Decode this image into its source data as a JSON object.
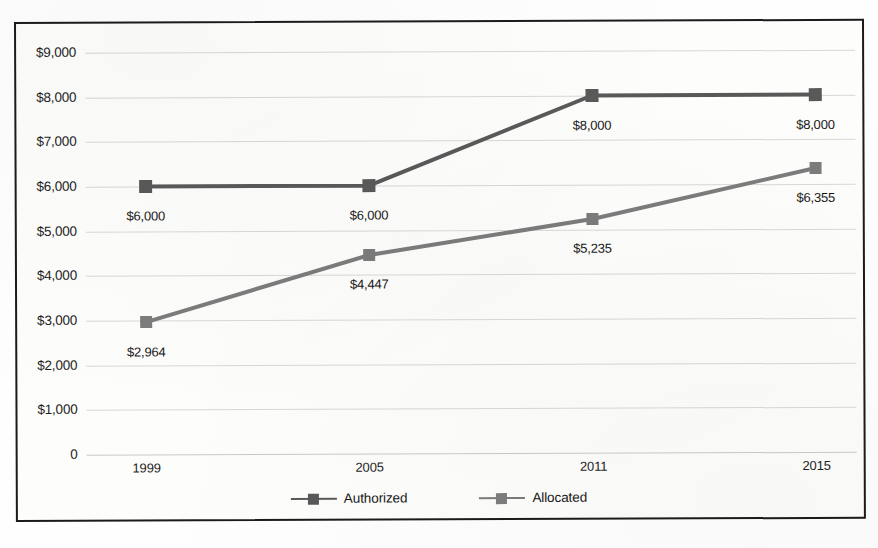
{
  "chart_data": {
    "type": "line",
    "title": "",
    "xlabel": "",
    "ylabel": "",
    "categories": [
      "1999",
      "2005",
      "2011",
      "2015"
    ],
    "ylim": [
      0,
      9000
    ],
    "ytick_values": [
      9000,
      8000,
      7000,
      6000,
      5000,
      4000,
      3000,
      2000,
      1000,
      0
    ],
    "ytick_labels": [
      "$9,000",
      "$8,000",
      "$7,000",
      "$6,000",
      "$5,000",
      "$4,000",
      "$3,000",
      "$2,000",
      "$1,000",
      "0"
    ],
    "grid": true,
    "legend_position": "bottom",
    "series": [
      {
        "name": "Authorized",
        "color": "#595959",
        "marker": "square",
        "values": [
          6000,
          6000,
          8000,
          8000
        ],
        "data_labels": [
          "$6,000",
          "$6,000",
          "$8,000",
          "$8,000"
        ]
      },
      {
        "name": "Allocated",
        "color": "#7c7c7c",
        "marker": "square",
        "values": [
          2964,
          4447,
          5235,
          6355
        ],
        "data_labels": [
          "$2,964",
          "$4,447",
          "$5,235",
          "$6,355"
        ]
      }
    ]
  },
  "legend": {
    "items": [
      {
        "label": "Authorized",
        "color": "#595959"
      },
      {
        "label": "Allocated",
        "color": "#7c7c7c"
      }
    ]
  },
  "colors": {
    "authorized": "#595959",
    "allocated": "#7c7c7c",
    "gridline": "#d8d8d6",
    "frame": "#1b1b1b",
    "text": "#1d1d1d",
    "background": "#fdfdfc"
  }
}
